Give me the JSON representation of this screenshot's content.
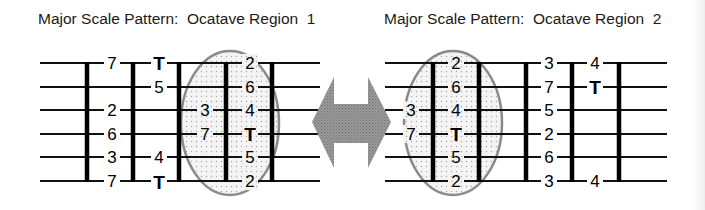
{
  "diagram_1": {
    "title": "Major Scale Pattern:  Ocatave Region  1",
    "columns": [
      {
        "x": 112,
        "notes": [
          "7",
          "",
          "2",
          "6",
          "3",
          "7"
        ]
      },
      {
        "x": 159,
        "notes": [
          "T",
          "5",
          "",
          "",
          "4",
          "T"
        ]
      },
      {
        "x": 205,
        "notes": [
          "",
          "",
          "3",
          "7",
          "",
          ""
        ]
      },
      {
        "x": 250,
        "notes": [
          "2",
          "6",
          "4",
          "T",
          "5",
          "2"
        ]
      }
    ],
    "highlighted_region": "ellipse around frets 3-5"
  },
  "diagram_2": {
    "title": "Major Scale Pattern:  Ocatave Region  2",
    "columns": [
      {
        "x": 411,
        "notes": [
          "",
          "",
          "3",
          "7",
          "",
          ""
        ]
      },
      {
        "x": 456,
        "notes": [
          "2",
          "6",
          "4",
          "T",
          "5",
          "2"
        ]
      },
      {
        "x": 549,
        "notes": [
          "3",
          "7",
          "5",
          "2",
          "6",
          "3"
        ]
      },
      {
        "x": 595,
        "notes": [
          "4",
          "T",
          "",
          "",
          "",
          "4"
        ]
      }
    ],
    "highlighted_region": "ellipse around frets 1-2"
  },
  "connector": {
    "type": "double-arrow",
    "color": "#8c8c8c"
  },
  "legend": {
    "T": "Tonic (root)"
  }
}
